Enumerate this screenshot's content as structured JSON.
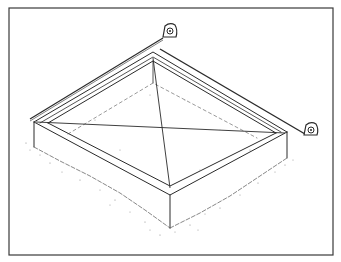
{
  "figure": {
    "colors": {
      "background": "#ffffff",
      "ink": "#2a2a2a",
      "border": "#3a3a3a",
      "speckle": "#8a8a8a"
    },
    "elements": [
      {
        "name": "outer-frame-border"
      },
      {
        "name": "square-form-box"
      },
      {
        "name": "diagonal-line-1"
      },
      {
        "name": "diagonal-line-2"
      },
      {
        "name": "tape-measure-left"
      },
      {
        "name": "tape-measure-right"
      },
      {
        "name": "ground-speckle"
      }
    ]
  }
}
